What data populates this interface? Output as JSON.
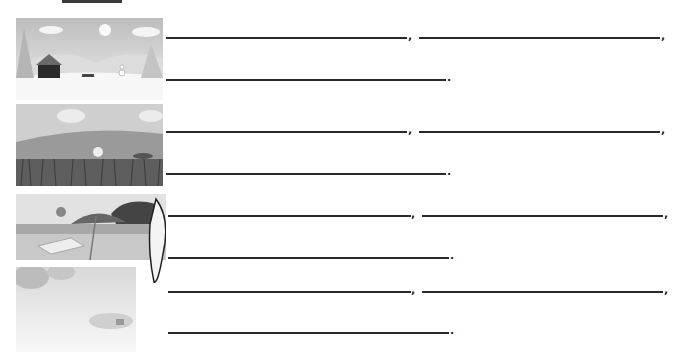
{
  "worksheet": {
    "rows": [
      {
        "season": "winter",
        "image": "winter-scene-icon",
        "line1_punct": ",",
        "line2_punct": ",",
        "line3_punct": "."
      },
      {
        "season": "spring",
        "image": "spring-meadow-icon",
        "line1_punct": ",",
        "line2_punct": ",",
        "line3_punct": "."
      },
      {
        "season": "summer",
        "image": "summer-beach-icon",
        "line1_punct": ",",
        "line2_punct": ",",
        "line3_punct": "."
      },
      {
        "season": "autumn",
        "image": "autumn-village-icon",
        "line1_punct": ",",
        "line2_punct": ",",
        "line3_punct": "."
      }
    ]
  }
}
